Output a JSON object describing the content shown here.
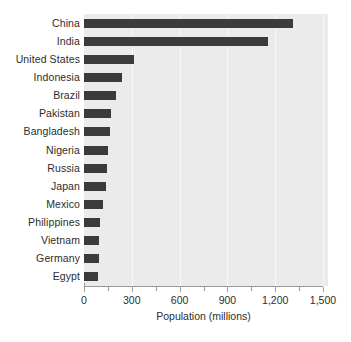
{
  "chart_data": {
    "type": "bar",
    "orientation": "horizontal",
    "title": "",
    "xlabel": "Population (millions)",
    "ylabel": "",
    "xlim": [
      0,
      1500
    ],
    "xticks": [
      0,
      300,
      600,
      900,
      1200,
      1500
    ],
    "xticklabels": [
      "0",
      "300",
      "600",
      "900",
      "1,200",
      "1,500"
    ],
    "minor_xticks": [
      150,
      450,
      750,
      1050,
      1350
    ],
    "grid": true,
    "grid_axis": "x",
    "legend": null,
    "bar_color": "#3b3b3b",
    "plot_background": "#ebebeb",
    "categories": [
      "China",
      "India",
      "United States",
      "Indonesia",
      "Brazil",
      "Pakistan",
      "Bangladesh",
      "Nigeria",
      "Russia",
      "Japan",
      "Mexico",
      "Philippines",
      "Vietnam",
      "Germany",
      "Egypt"
    ],
    "values": [
      1310,
      1154,
      315,
      241,
      200,
      172,
      164,
      151,
      145,
      137,
      122,
      101,
      95,
      94,
      88
    ]
  }
}
